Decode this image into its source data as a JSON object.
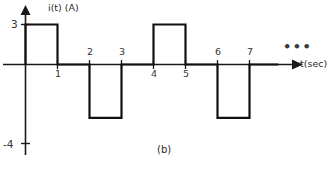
{
  "figure": {
    "caption": "(b)",
    "ellipsis": "•••"
  },
  "axes": {
    "y_axis_label": "i(t) (A)",
    "x_axis_label": "t(sec)",
    "y_tick_labels": [
      {
        "text": "3",
        "value": 3
      },
      {
        "text": "-4",
        "value": -4
      }
    ],
    "x_tick_labels": [
      {
        "text": "1",
        "value": 1
      },
      {
        "text": "2",
        "value": 2
      },
      {
        "text": "3",
        "value": 3
      },
      {
        "text": "4",
        "value": 4
      },
      {
        "text": "5",
        "value": 5
      },
      {
        "text": "6",
        "value": 6
      },
      {
        "text": "7",
        "value": 7
      }
    ]
  },
  "chart_data": {
    "type": "line",
    "title": "",
    "subtitle": "",
    "xlabel": "t(sec)",
    "ylabel": "i(t) (A)",
    "xlim": [
      0,
      7.9
    ],
    "ylim": [
      -4.6,
      3.6
    ],
    "grid": false,
    "legend": null,
    "annotations": [
      "(b)",
      "•••"
    ],
    "period": 4,
    "amplitude_positive": 3,
    "amplitude_negative": -4,
    "x_ticks": [
      1,
      2,
      3,
      4,
      5,
      6,
      7
    ],
    "y_ticks": [
      3,
      -4
    ],
    "series": [
      {
        "name": "i(t)",
        "color": "#111111",
        "x": [
          0,
          0,
          1,
          1,
          2,
          2,
          3,
          3,
          4,
          4,
          5,
          5,
          6,
          6,
          7,
          7,
          7.9
        ],
        "values": [
          0,
          3,
          3,
          0,
          0,
          -4,
          -4,
          0,
          0,
          3,
          3,
          0,
          0,
          -4,
          -4,
          0,
          0
        ]
      }
    ],
    "segments": [
      {
        "t_start": 0,
        "t_end": 1,
        "value": 3
      },
      {
        "t_start": 1,
        "t_end": 2,
        "value": 0
      },
      {
        "t_start": 2,
        "t_end": 3,
        "value": -4
      },
      {
        "t_start": 3,
        "t_end": 4,
        "value": 0
      },
      {
        "t_start": 4,
        "t_end": 5,
        "value": 3
      },
      {
        "t_start": 5,
        "t_end": 6,
        "value": 0
      },
      {
        "t_start": 6,
        "t_end": 7,
        "value": -4
      },
      {
        "t_start": 7,
        "t_end": 7.9,
        "value": 0
      }
    ]
  }
}
